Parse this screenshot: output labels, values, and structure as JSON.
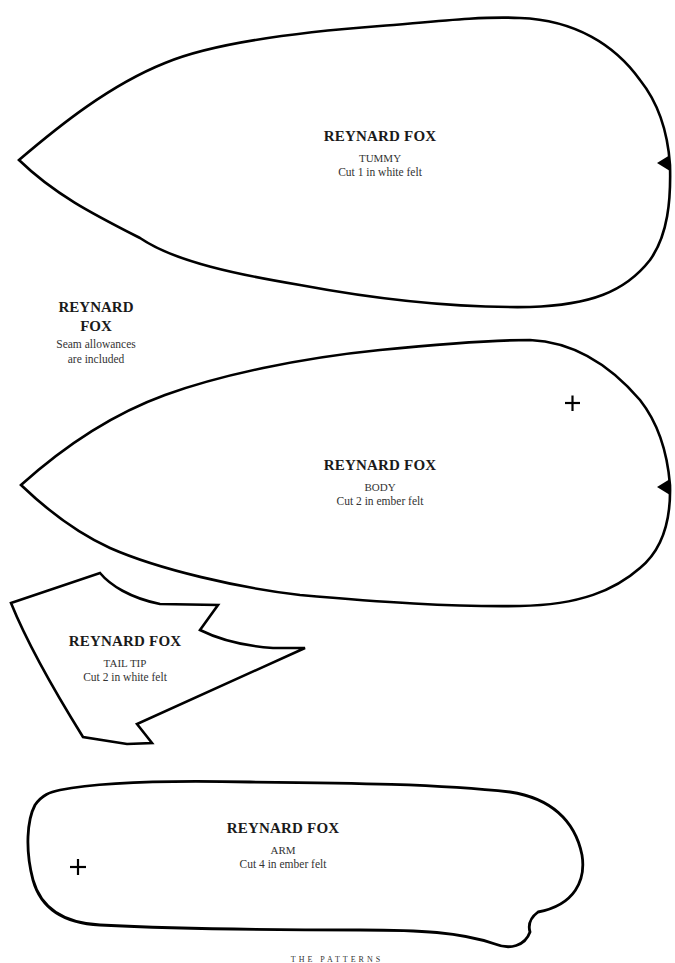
{
  "side_note": {
    "title_line1": "REYNARD",
    "title_line2": "FOX",
    "note_line1": "Seam allowances",
    "note_line2": "are included"
  },
  "pieces": [
    {
      "title": "REYNARD FOX",
      "part": "TUMMY",
      "cut": "Cut 1 in white felt",
      "marks": [
        "notch-triangle"
      ]
    },
    {
      "title": "REYNARD FOX",
      "part": "BODY",
      "cut": "Cut 2 in ember felt",
      "marks": [
        "cross-mark",
        "notch-triangle"
      ]
    },
    {
      "title": "REYNARD FOX",
      "part": "TAIL TIP",
      "cut": "Cut 2 in white felt",
      "marks": []
    },
    {
      "title": "REYNARD FOX",
      "part": "ARM",
      "cut": "Cut 4 in ember felt",
      "marks": [
        "cross-mark"
      ]
    }
  ],
  "footer": {
    "text": "THE PATTERNS"
  },
  "colors": {
    "outline": "#000000",
    "text": "#1a1a1a",
    "background": "#ffffff"
  }
}
